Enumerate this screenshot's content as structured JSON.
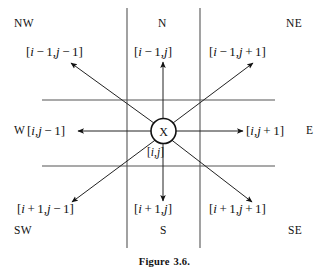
{
  "figure": {
    "caption_label": "Figure",
    "caption_number": "3.6.",
    "center_marker": "X",
    "center_label": "[i,j]",
    "colors": {
      "ink": "#111111",
      "grid": "#555555",
      "background": "#ffffff"
    }
  },
  "compass": {
    "nw": "NW",
    "n": "N",
    "ne": "NE",
    "w": "W",
    "e": "E",
    "sw": "SW",
    "s": "S",
    "se": "SE"
  },
  "neighbors": {
    "nw": {
      "name": "north-west-neighbor",
      "text": "[i − 1, j − 1]",
      "open": "[",
      "row_var": "i",
      "row_op": "−",
      "row_off": "1",
      "comma": ",",
      "col_var": "j",
      "col_op": "−",
      "col_off": "1",
      "close": "]"
    },
    "n": {
      "name": "north-neighbor",
      "text": "[i − 1, j]",
      "open": "[",
      "row_var": "i",
      "row_op": "−",
      "row_off": "1",
      "comma": ",",
      "col_var": "j",
      "close": "]"
    },
    "ne": {
      "name": "north-east-neighbor",
      "text": "[i − 1, j + 1]",
      "open": "[",
      "row_var": "i",
      "row_op": "−",
      "row_off": "1",
      "comma": ",",
      "col_var": "j",
      "col_op": "+",
      "col_off": "1",
      "close": "]"
    },
    "w": {
      "name": "west-neighbor",
      "text": "[i, j − 1]",
      "open": "[",
      "row_var": "i",
      "comma": ",",
      "col_var": "j",
      "col_op": "−",
      "col_off": "1",
      "close": "]"
    },
    "e": {
      "name": "east-neighbor",
      "text": "[i, j + 1]",
      "open": "[",
      "row_var": "i",
      "comma": ",",
      "col_var": "j",
      "col_op": "+",
      "col_off": "1",
      "close": "]"
    },
    "sw": {
      "name": "south-west-neighbor",
      "text": "[i + 1, j − 1]",
      "open": "[",
      "row_var": "i",
      "row_op": "+",
      "row_off": "1",
      "comma": ",",
      "col_var": "j",
      "col_op": "−",
      "col_off": "1",
      "close": "]"
    },
    "s": {
      "name": "south-neighbor",
      "text": "[i + 1, j]",
      "open": "[",
      "row_var": "i",
      "row_op": "+",
      "row_off": "1",
      "comma": ",",
      "col_var": "j",
      "close": "]"
    },
    "se": {
      "name": "south-east-neighbor",
      "text": "[i + 1, j + 1]",
      "open": "[",
      "row_var": "i",
      "row_op": "+",
      "row_off": "1",
      "comma": ",",
      "col_var": "j",
      "col_op": "+",
      "col_off": "1",
      "close": "]"
    }
  }
}
